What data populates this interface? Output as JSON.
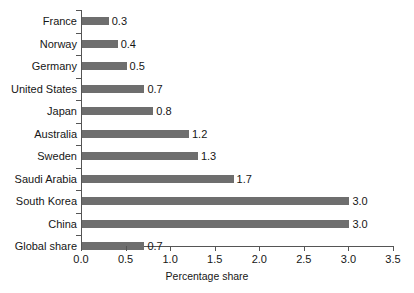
{
  "chart_data": {
    "type": "bar",
    "orientation": "horizontal",
    "title": "",
    "xlabel": "Percentage share",
    "ylabel": "",
    "categories": [
      "France",
      "Norway",
      "Germany",
      "United States",
      "Japan",
      "Australia",
      "Sweden",
      "Saudi Arabia",
      "South Korea",
      "China",
      "Global share"
    ],
    "values": [
      0.3,
      0.4,
      0.5,
      0.7,
      0.8,
      1.2,
      1.3,
      1.7,
      3.0,
      3.0,
      0.7
    ],
    "data_labels": [
      "0.3",
      "0.4",
      "0.5",
      "0.7",
      "0.8",
      "1.2",
      "1.3",
      "1.7",
      "3.0",
      "3.0",
      "0.7"
    ],
    "xlim": [
      0.0,
      3.5
    ],
    "xticks": [
      0.0,
      0.5,
      1.0,
      1.5,
      2.0,
      2.5,
      3.0,
      3.5
    ],
    "xtick_labels": [
      "0.0",
      "0.5",
      "1.0",
      "1.5",
      "2.0",
      "2.5",
      "3.0",
      "3.5"
    ],
    "grid": false,
    "legend": null,
    "bar_color": "#6e6e6e",
    "axis_color": "#555555",
    "background_color": "#ffffff",
    "text_color": "#161616"
  }
}
